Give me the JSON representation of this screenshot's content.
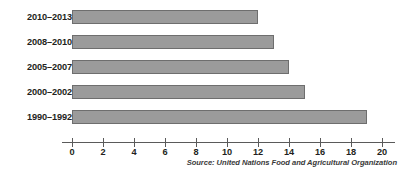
{
  "chart_data": {
    "type": "bar",
    "orientation": "horizontal",
    "title": "",
    "subtitle": "",
    "xlabel": "",
    "ylabel": "",
    "categories": [
      "2010–2013",
      "2008–2010",
      "2005–2007",
      "2000–2002",
      "1990–1992"
    ],
    "values": [
      12,
      13,
      14,
      15,
      19
    ],
    "series": [
      {
        "name": "",
        "values": [
          12,
          13,
          14,
          15,
          19
        ]
      }
    ],
    "xlim": [
      0,
      20
    ],
    "xticks": [
      0,
      2,
      4,
      6,
      8,
      10,
      12,
      14,
      16,
      18,
      20
    ],
    "xtick_labels": [
      "0",
      "2",
      "4",
      "6",
      "8",
      "10",
      "12",
      "14",
      "16",
      "18",
      "20"
    ],
    "grid": false,
    "legend": false,
    "legend_position": "none",
    "bar_color": "#9b9b9b",
    "bar_border_color": "#6e6e6e",
    "axis_color": "#5a5a5a",
    "text_color": "#231f20",
    "background_color": "#ffffff",
    "annotations": [
      "Source: United Nations Food and Agricultural Organization"
    ]
  },
  "figure": {
    "source_note": "Source: United Nations Food and Agricultural Organization"
  }
}
